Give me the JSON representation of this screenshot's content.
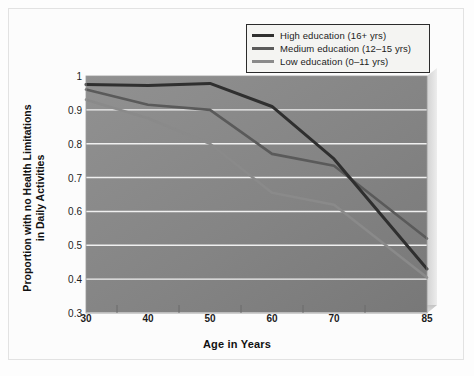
{
  "chart_data": {
    "type": "line",
    "title": "",
    "xlabel": "Age in Years",
    "ylabel": "Proportion with no Health Limitations in Daily Activities",
    "ylabel_line1": "Proportion with no Health Limitations",
    "ylabel_line2": "in Daily Activities",
    "x": [
      30,
      40,
      50,
      60,
      70,
      85
    ],
    "xtick_labels": [
      "30",
      "40",
      "50",
      "60",
      "70",
      "85"
    ],
    "ytick_labels": [
      "1",
      "0.9",
      "0.8",
      "0.7",
      "0.6",
      "0.5",
      "0.4",
      "0.3"
    ],
    "ytick_values": [
      1,
      0.9,
      0.8,
      0.7,
      0.6,
      0.5,
      0.4,
      0.3
    ],
    "xlim": [
      30,
      85
    ],
    "ylim": [
      0.3,
      1
    ],
    "grid": "horizontal",
    "legend_position": "top-right",
    "series": [
      {
        "name": "High education (16+ yrs)",
        "color": "#2f2f2f",
        "values": [
          0.975,
          0.972,
          0.978,
          0.91,
          0.755,
          0.43
        ]
      },
      {
        "name": "Medium education (12–15 yrs)",
        "color": "#5a5a5a",
        "values": [
          0.96,
          0.915,
          0.9,
          0.77,
          0.735,
          0.52
        ]
      },
      {
        "name": "Low education (0–11 yrs)",
        "color": "#8a8a8a",
        "values": [
          0.93,
          0.875,
          0.8,
          0.655,
          0.62,
          0.405
        ]
      }
    ]
  },
  "legend": {
    "items": [
      {
        "label": "High education (16+ yrs)",
        "color": "#2f2f2f"
      },
      {
        "label": "Medium education (12–15 yrs)",
        "color": "#5a5a5a"
      },
      {
        "label": "Low education (0–11 yrs)",
        "color": "#8a8a8a"
      }
    ]
  },
  "style": {
    "plot_fill_top_left": "#8e8e8e",
    "plot_fill_bottom_right": "#7a7a7a",
    "gridline_color": "#efefef",
    "side_panel_color": "#dcdcdc",
    "base_panel_color": "#c9c9c9",
    "frame_border": "#e2e2e2",
    "page_background": "#fdfdfd"
  }
}
